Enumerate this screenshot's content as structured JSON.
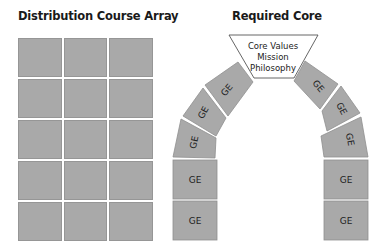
{
  "titles": {
    "left": "Distribution Course Array",
    "right": "Required Core"
  },
  "grid": {
    "rows": 5,
    "cols": 3,
    "cell_color": "#a9a9a9"
  },
  "keystone": {
    "line1": "Core Values",
    "line2": "Mission",
    "line3": "Philosophy"
  },
  "arch_blocks": {
    "left": [
      "GE",
      "GE",
      "GE",
      "GE",
      "GE"
    ],
    "right": [
      "GE",
      "GE",
      "GE",
      "GE",
      "GE"
    ]
  },
  "colors": {
    "block_fill": "#a9a9a9",
    "block_edge": "#8f8f8f",
    "keystone_fill": "#ffffff"
  }
}
